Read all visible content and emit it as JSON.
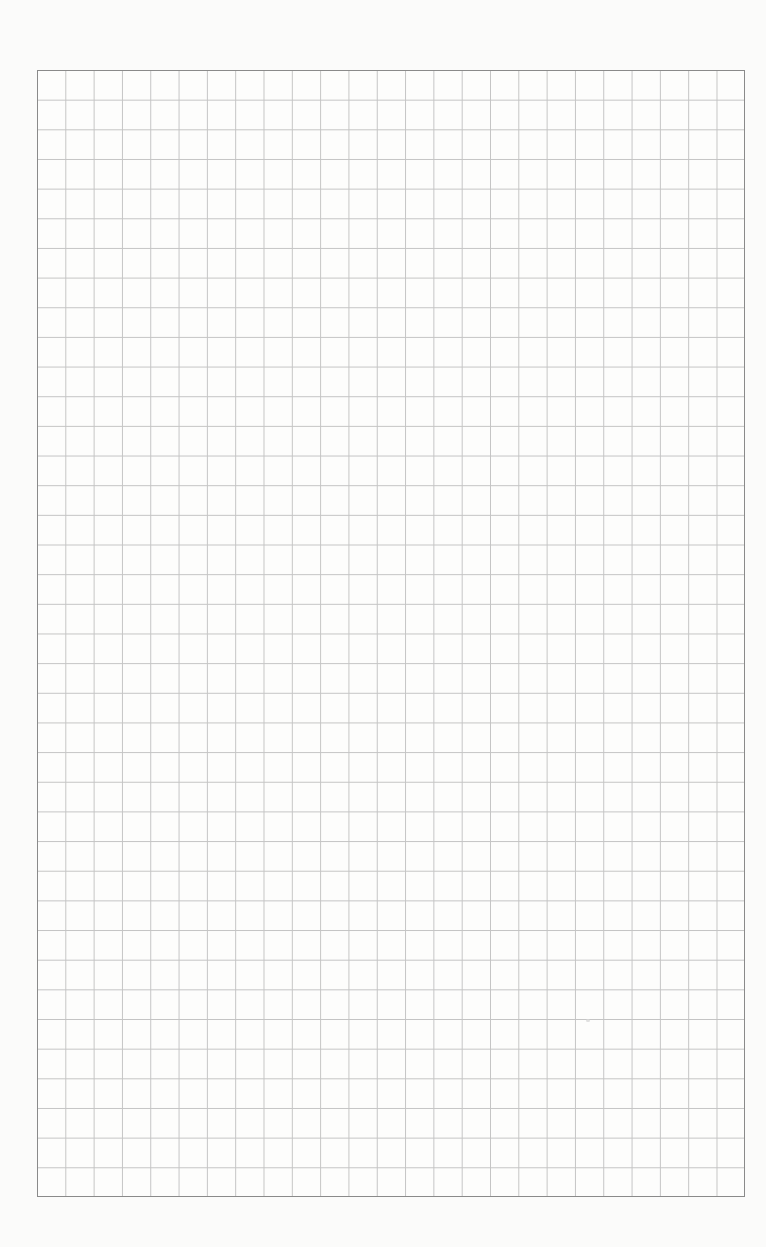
{
  "document": {
    "type": "graph-paper",
    "grid": {
      "columns": 25,
      "rows": 38,
      "cell_width_px": 28.32,
      "cell_height_px": 29.66
    },
    "colors": {
      "page_background": "#fbfbfa",
      "grid_line": "#c4c4c4",
      "border": "#8a8a8a"
    }
  }
}
